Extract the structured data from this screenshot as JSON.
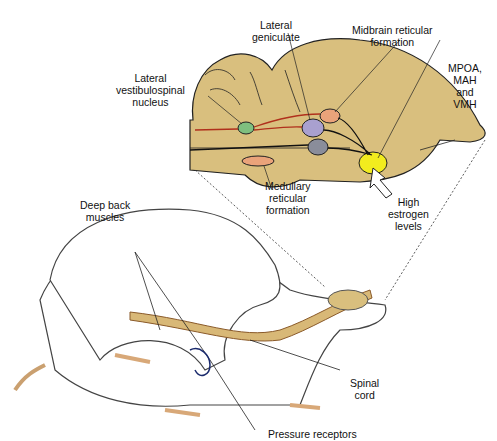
{
  "labels": {
    "lateral_geniculate": [
      "Lateral",
      "geniculate"
    ],
    "midbrain_reticular": [
      "Midbrain reticular",
      "formation"
    ],
    "lateral_vestibulospinal": [
      "Lateral",
      "vestibulospinal",
      "nucleus"
    ],
    "mpoa": [
      "MPOA,",
      "MAH",
      "and",
      "VMH"
    ],
    "medullary_reticular": [
      "Medullary",
      "reticular",
      "formation"
    ],
    "high_estrogen": [
      "High",
      "estrogen",
      "levels"
    ],
    "deep_back_muscles": [
      "Deep back",
      "muscles"
    ],
    "spinal_cord": [
      "Spinal",
      "cord"
    ],
    "pressure_receptors": "Pressure receptors"
  },
  "colors": {
    "brain": "#d9bf7e",
    "vestibulospinal": "#7fbf7f",
    "lateral_geniculate": "#a9a0cf",
    "midbrain_reticular": "#eaa37a",
    "gray_nucleus": "#8a8d9a",
    "medullary": "#eaa37a",
    "mpoa": "#f2ec1e",
    "red_path": "#b0301c",
    "rat_body": "#ffffff",
    "rat_outline": "#444444"
  }
}
